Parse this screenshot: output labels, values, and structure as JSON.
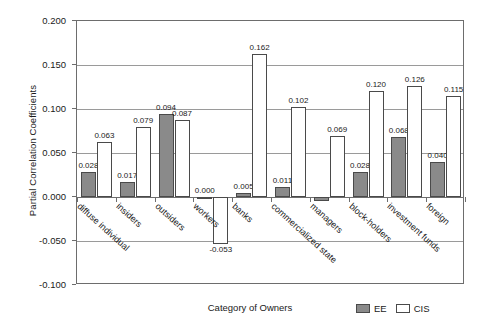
{
  "chart_data": {
    "type": "bar",
    "title": "",
    "xlabel": "Category of Owners",
    "ylabel": "Partial Correlation Coefficients",
    "ylim": [
      -0.1,
      0.2
    ],
    "yticks": [
      "0.200",
      "0.150",
      "0.100",
      "0.050",
      "0.000",
      "-0.050",
      "-0.100"
    ],
    "ytick_values": [
      0.2,
      0.15,
      0.1,
      0.05,
      0.0,
      -0.05,
      -0.1
    ],
    "grid": true,
    "legend_position": "bottom-right",
    "categories": [
      "diffuse individual",
      "insiders",
      "outsiders",
      "workers",
      "banks",
      "commercialized state",
      "managers",
      "block-holders",
      "investment funds",
      "foreign"
    ],
    "series": [
      {
        "name": "EE",
        "color": "#8a8a8a",
        "values": [
          0.028,
          0.017,
          0.094,
          0.0,
          0.005,
          0.011,
          -0.004,
          0.028,
          0.068,
          0.04
        ],
        "labels": [
          "0.028",
          "0.017",
          "0.094",
          "0.000",
          "0.005",
          "0.011",
          "",
          "0.028",
          "0.068",
          "0.040"
        ]
      },
      {
        "name": "CIS",
        "color": "#ffffff",
        "values": [
          0.063,
          0.079,
          0.087,
          -0.053,
          0.162,
          0.102,
          0.069,
          0.12,
          0.126,
          0.115
        ],
        "labels": [
          "0.063",
          "0.079",
          "0.087",
          "-0.053",
          "0.162",
          "0.102",
          "0.069",
          "0.120",
          "0.126",
          "0.115"
        ]
      }
    ]
  },
  "legend": {
    "entries": [
      {
        "label": "EE"
      },
      {
        "label": "CIS"
      }
    ]
  }
}
